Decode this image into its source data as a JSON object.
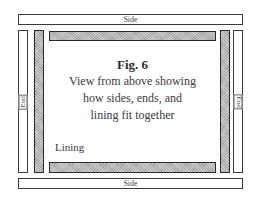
{
  "figure": {
    "title": "Fig. 6",
    "description_lines": [
      "View from above showing",
      "how sides, ends, and",
      "lining fit together"
    ]
  },
  "labels": {
    "side_top": "Side",
    "side_bottom": "Side",
    "end_left": "End",
    "end_right": "End",
    "lining": "Lining"
  },
  "colors": {
    "outline": "#3a3a3a",
    "lining_fill": "#b8b8b8",
    "board_fill": "#ffffff",
    "text": "#3a3a3a"
  }
}
